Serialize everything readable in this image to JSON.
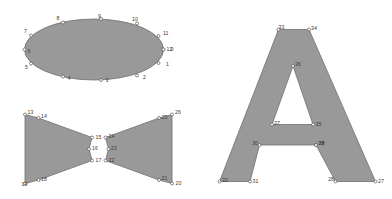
{
  "figure": {
    "background_color": "#ffffff",
    "fill_color": "#999999",
    "stroke_color": "#6e6e6e",
    "marker_fill_color": "#ffffff",
    "marker_stroke_color": "#555555",
    "label_color": "#3a3a3a",
    "width": 392,
    "height": 199
  },
  "chart_data": {
    "type": "scatter",
    "title": "",
    "subtitle": "",
    "xlabel": "",
    "ylabel": "",
    "grid": false,
    "legend": "none",
    "xlim": [
      0,
      392
    ],
    "ylim": [
      0,
      199
    ],
    "shapes": [
      {
        "name": "ellipse",
        "fill": "#999999",
        "outline": "#6e6e6e",
        "vertex_ids": [
          0,
          1,
          2,
          3,
          4,
          5,
          6,
          7,
          8,
          9,
          10,
          11,
          12
        ],
        "points": [
          {
            "id": "0",
            "x": 163.5,
            "y": 49.5,
            "lx": 170.5,
            "ly": 49.5,
            "anchor": "start"
          },
          {
            "id": "1",
            "x": 158.5,
            "y": 63.0,
            "lx": 166.0,
            "ly": 64.5,
            "anchor": "start"
          },
          {
            "id": "2",
            "x": 137.0,
            "y": 75.5,
            "lx": 143.0,
            "ly": 77.5,
            "anchor": "start"
          },
          {
            "id": "3",
            "x": 101.0,
            "y": 80.0,
            "lx": 105.5,
            "ly": 80.5,
            "anchor": "start"
          },
          {
            "id": "4",
            "x": 63.0,
            "y": 76.5,
            "lx": 67.5,
            "ly": 79.0,
            "anchor": "start"
          },
          {
            "id": "5",
            "x": 31.0,
            "y": 63.5,
            "lx": 25.0,
            "ly": 67.5,
            "anchor": "start"
          },
          {
            "id": "6",
            "x": 24.5,
            "y": 49.5,
            "lx": 27.5,
            "ly": 51.5,
            "anchor": "start"
          },
          {
            "id": "7",
            "x": 31.0,
            "y": 35.5,
            "lx": 24.0,
            "ly": 32.0,
            "anchor": "start"
          },
          {
            "id": "8",
            "x": 63.0,
            "y": 22.5,
            "lx": 56.5,
            "ly": 19.0,
            "anchor": "start"
          },
          {
            "id": "9",
            "x": 101.0,
            "y": 19.0,
            "lx": 98.0,
            "ly": 17.0,
            "anchor": "start"
          },
          {
            "id": "10",
            "x": 137.0,
            "y": 23.5,
            "lx": 132.0,
            "ly": 19.5,
            "anchor": "start"
          },
          {
            "id": "11",
            "x": 158.5,
            "y": 36.0,
            "lx": 163.0,
            "ly": 33.5,
            "anchor": "start"
          },
          {
            "id": "12",
            "x": 163.5,
            "y": 49.5,
            "lx": 166.5,
            "ly": 49.5,
            "anchor": "start"
          }
        ]
      },
      {
        "name": "bowtie",
        "fill": "#999999",
        "outline": "#6e6e6e",
        "vertex_ids": [
          13,
          14,
          15,
          16,
          17,
          18,
          19,
          20,
          21,
          22,
          23,
          24,
          25,
          26
        ],
        "points": [
          {
            "id": "13",
            "x": 25.0,
            "y": 114.5,
            "lx": 27.5,
            "ly": 112.5,
            "anchor": "start"
          },
          {
            "id": "14",
            "x": 38.5,
            "y": 118.0,
            "lx": 41.0,
            "ly": 117.0,
            "anchor": "start"
          },
          {
            "id": "15",
            "x": 92.0,
            "y": 137.5,
            "lx": 95.5,
            "ly": 137.5,
            "anchor": "start"
          },
          {
            "id": "16",
            "x": 89.0,
            "y": 149.0,
            "lx": 92.0,
            "ly": 148.5,
            "anchor": "start"
          },
          {
            "id": "17",
            "x": 92.0,
            "y": 160.5,
            "lx": 95.5,
            "ly": 160.5,
            "anchor": "start"
          },
          {
            "id": "18",
            "x": 38.5,
            "y": 180.0,
            "lx": 41.0,
            "ly": 180.0,
            "anchor": "start"
          },
          {
            "id": "19",
            "x": 25.0,
            "y": 183.5,
            "lx": 21.5,
            "ly": 184.5,
            "anchor": "start"
          },
          {
            "id": "20",
            "x": 172.0,
            "y": 183.5,
            "lx": 175.5,
            "ly": 184.0,
            "anchor": "start"
          },
          {
            "id": "21",
            "x": 159.0,
            "y": 180.0,
            "lx": 161.5,
            "ly": 178.5,
            "anchor": "start"
          },
          {
            "id": "22",
            "x": 105.5,
            "y": 160.5,
            "lx": 108.5,
            "ly": 160.5,
            "anchor": "start"
          },
          {
            "id": "23",
            "x": 108.5,
            "y": 149.0,
            "lx": 111.0,
            "ly": 148.5,
            "anchor": "start"
          },
          {
            "id": "24",
            "x": 105.5,
            "y": 137.5,
            "lx": 108.5,
            "ly": 137.0,
            "anchor": "start"
          },
          {
            "id": "25",
            "x": 159.0,
            "y": 118.0,
            "lx": 161.5,
            "ly": 117.5,
            "anchor": "start"
          },
          {
            "id": "26",
            "x": 172.0,
            "y": 114.5,
            "lx": 175.0,
            "ly": 113.0,
            "anchor": "start"
          }
        ]
      },
      {
        "name": "letter-a",
        "fill": "#999999",
        "outline": "#6e6e6e",
        "vertex_ids": [
          27,
          28,
          29,
          30,
          31,
          32,
          33,
          34,
          35,
          36,
          37,
          38
        ],
        "outer_points": [
          {
            "id": "27",
            "x": 375.5,
            "y": 181.5,
            "lx": 378.0,
            "ly": 181.5,
            "anchor": "start"
          },
          {
            "id": "28",
            "x": 335.5,
            "y": 181.5,
            "lx": 334.0,
            "ly": 180.0,
            "anchor": "end"
          },
          {
            "id": "29",
            "x": 316.0,
            "y": 145.0,
            "lx": 318.5,
            "ly": 144.0,
            "anchor": "start"
          },
          {
            "id": "30",
            "x": 259.5,
            "y": 145.0,
            "lx": 258.0,
            "ly": 143.5,
            "anchor": "end"
          },
          {
            "id": "31",
            "x": 250.0,
            "y": 181.5,
            "lx": 252.5,
            "ly": 181.5,
            "anchor": "start"
          },
          {
            "id": "32",
            "x": 219.5,
            "y": 181.5,
            "lx": 222.0,
            "ly": 181.0,
            "anchor": "start"
          },
          {
            "id": "33",
            "x": 278.5,
            "y": 29.5,
            "lx": 278.5,
            "ly": 28.0,
            "anchor": "start"
          },
          {
            "id": "34",
            "x": 309.0,
            "y": 29.5,
            "lx": 311.0,
            "ly": 28.5,
            "anchor": "start"
          }
        ],
        "inner_points": [
          {
            "id": "35",
            "x": 313.0,
            "y": 124.5,
            "lx": 315.5,
            "ly": 124.5,
            "anchor": "start"
          },
          {
            "id": "36",
            "x": 293.0,
            "y": 66.0,
            "lx": 295.0,
            "ly": 64.5,
            "anchor": "start"
          },
          {
            "id": "37",
            "x": 272.0,
            "y": 124.5,
            "lx": 274.0,
            "ly": 123.5,
            "anchor": "start"
          }
        ],
        "extra_points": [
          {
            "id": "38",
            "x": 316.0,
            "y": 145.0,
            "lx": 318.5,
            "ly": 144.0,
            "anchor": "start"
          }
        ]
      }
    ]
  }
}
